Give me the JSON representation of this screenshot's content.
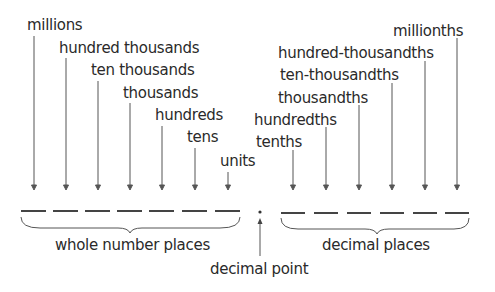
{
  "whole_places": [
    {
      "label": "millions",
      "text_x": 27,
      "text_y": 18,
      "line_x": 34,
      "line_top": 36
    },
    {
      "label": "hundred thousands",
      "text_x": 59,
      "text_y": 41,
      "line_x": 66,
      "line_top": 58
    },
    {
      "label": "ten thousands",
      "text_x": 91,
      "text_y": 63,
      "line_x": 98,
      "line_top": 81
    },
    {
      "label": "thousands",
      "text_x": 123,
      "text_y": 86,
      "line_x": 130,
      "line_top": 103
    },
    {
      "label": "hundreds",
      "text_x": 155,
      "text_y": 108,
      "line_x": 162,
      "line_top": 126
    },
    {
      "label": "tens",
      "text_x": 187,
      "text_y": 130,
      "line_x": 195,
      "line_top": 148
    },
    {
      "label": "units",
      "text_x": 220,
      "text_y": 154,
      "line_x": 228,
      "line_top": 172
    }
  ],
  "decimal_places": [
    {
      "label": "tenths",
      "text_x": 256,
      "text_y": 135,
      "line_x": 293,
      "line_top": 150
    },
    {
      "label": "hundredths",
      "text_x": 254,
      "text_y": 113,
      "line_x": 326,
      "line_top": 127
    },
    {
      "label": "thousandths",
      "text_x": 278,
      "text_y": 91,
      "line_x": 359,
      "line_top": 105
    },
    {
      "label": "ten-thousandths",
      "text_x": 280,
      "text_y": 68,
      "line_x": 392,
      "line_top": 83
    },
    {
      "label": "hundred-thousandths",
      "text_x": 278,
      "text_y": 46,
      "line_x": 425,
      "line_top": 61
    },
    {
      "label": "millionths",
      "text_x": 393,
      "text_y": 24,
      "line_x": 457,
      "line_top": 38
    }
  ],
  "group_labels": {
    "whole": "whole number places",
    "decimal": "decimal places",
    "point": "decimal point"
  },
  "colors": {
    "text": "#2a2a2a",
    "line": "#555555",
    "background": "#ffffff"
  }
}
